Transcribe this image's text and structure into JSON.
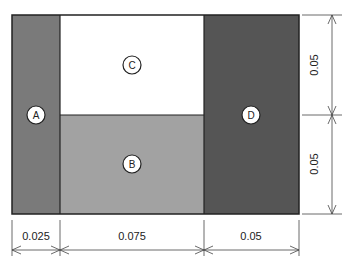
{
  "diagram": {
    "regions": [
      {
        "id": "A",
        "label": "A",
        "fill": "#7a7a7a",
        "x": 12,
        "y": 15,
        "w": 48,
        "h": 199,
        "cx": 36,
        "cy": 115
      },
      {
        "id": "C",
        "label": "C",
        "fill": "#ffffff",
        "x": 60,
        "y": 15,
        "w": 144,
        "h": 100,
        "cx": 132,
        "cy": 65
      },
      {
        "id": "B",
        "label": "B",
        "fill": "#a2a2a2",
        "x": 60,
        "y": 115,
        "w": 144,
        "h": 99,
        "cx": 132,
        "cy": 164
      },
      {
        "id": "D",
        "label": "D",
        "fill": "#555555",
        "x": 204,
        "y": 15,
        "w": 95,
        "h": 199,
        "cx": 251,
        "cy": 115
      }
    ],
    "dimensions": {
      "horizontal": [
        {
          "label": "0.025",
          "x1": 12,
          "x2": 60
        },
        {
          "label": "0.075",
          "x1": 60,
          "x2": 204
        },
        {
          "label": "0.05",
          "x1": 204,
          "x2": 299
        }
      ],
      "vertical": [
        {
          "label": "0.05",
          "y1": 15,
          "y2": 115
        },
        {
          "label": "0.05",
          "y1": 115,
          "y2": 214
        }
      ]
    }
  }
}
